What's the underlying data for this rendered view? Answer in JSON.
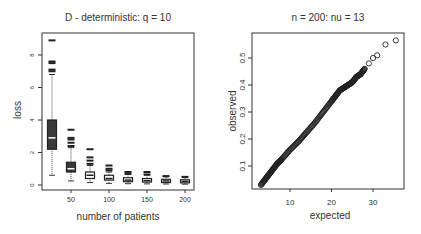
{
  "chart_data": [
    {
      "type": "boxplot",
      "title": "D - deterministic: q = 10",
      "xlabel": "number of patients",
      "ylabel": "loss",
      "categories": [
        25,
        50,
        75,
        100,
        125,
        150,
        175,
        200
      ],
      "x_tick_labels": [
        "50",
        "100",
        "150",
        "200"
      ],
      "y_tick_labels": [
        "0",
        "2",
        "4",
        "6",
        "8"
      ],
      "ylim": [
        0,
        9
      ],
      "boxes": [
        {
          "x": 25,
          "whisker_low": 0.6,
          "q1": 2.2,
          "median": 2.9,
          "q3": 4.0,
          "whisker_high": 6.8,
          "outliers": [
            7.0,
            7.1,
            7.5,
            7.6,
            8.9
          ]
        },
        {
          "x": 50,
          "whisker_low": 0.25,
          "q1": 0.8,
          "median": 1.0,
          "q3": 1.4,
          "whisker_high": 2.3,
          "outliers": [
            2.4,
            2.6,
            2.8,
            2.9,
            3.4
          ]
        },
        {
          "x": 75,
          "whisker_low": 0.15,
          "q1": 0.4,
          "median": 0.6,
          "q3": 0.8,
          "whisker_high": 1.2,
          "outliers": [
            1.3,
            1.5,
            1.7,
            2.2
          ]
        },
        {
          "x": 100,
          "whisker_low": 0.1,
          "q1": 0.3,
          "median": 0.4,
          "q3": 0.6,
          "whisker_high": 0.8,
          "outliers": [
            0.9,
            1.0,
            1.2
          ]
        },
        {
          "x": 125,
          "whisker_low": 0.08,
          "q1": 0.2,
          "median": 0.3,
          "q3": 0.45,
          "whisker_high": 0.65,
          "outliers": [
            0.7,
            0.8
          ]
        },
        {
          "x": 150,
          "whisker_low": 0.07,
          "q1": 0.18,
          "median": 0.27,
          "q3": 0.4,
          "whisker_high": 0.6,
          "outliers": [
            0.65,
            0.8
          ]
        },
        {
          "x": 175,
          "whisker_low": 0.06,
          "q1": 0.15,
          "median": 0.25,
          "q3": 0.35,
          "whisker_high": 0.5,
          "outliers": [
            0.55
          ]
        },
        {
          "x": 200,
          "whisker_low": 0.05,
          "q1": 0.13,
          "median": 0.22,
          "q3": 0.32,
          "whisker_high": 0.45,
          "outliers": [
            0.5
          ]
        }
      ]
    },
    {
      "type": "scatter",
      "title": "n = 200: nu = 13",
      "xlabel": "expected",
      "ylabel": "observed",
      "x_tick_labels": [
        "10",
        "20",
        "30"
      ],
      "y_tick_labels": [
        "0.1",
        "0.2",
        "0.3",
        "0.4",
        "0.5"
      ],
      "xlim": [
        2,
        38
      ],
      "ylim": [
        0.02,
        0.58
      ],
      "points_description": "approximately linear QQ-style cloud from (3, 0.03) to (29, 0.51), with outliers",
      "series": [
        {
          "name": "qq",
          "x": [
            3,
            4,
            5,
            6,
            7,
            8,
            10,
            12,
            14,
            16,
            18,
            20,
            21,
            22,
            23,
            24,
            25,
            26,
            27,
            28,
            29,
            30,
            31,
            33,
            35.5
          ],
          "y": [
            0.03,
            0.05,
            0.07,
            0.09,
            0.11,
            0.125,
            0.16,
            0.19,
            0.225,
            0.26,
            0.3,
            0.34,
            0.36,
            0.38,
            0.39,
            0.4,
            0.41,
            0.43,
            0.44,
            0.46,
            0.48,
            0.5,
            0.51,
            0.55,
            0.565
          ]
        }
      ]
    }
  ]
}
